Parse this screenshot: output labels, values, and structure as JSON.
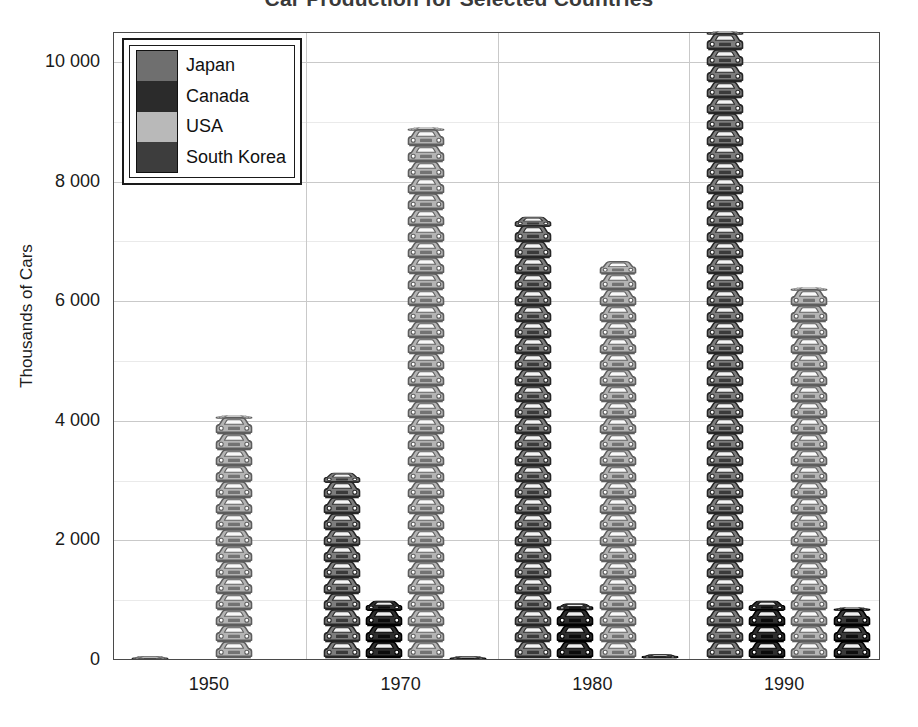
{
  "chart_data": {
    "type": "bar",
    "title": "Car Production for Selected Countries",
    "xlabel": "",
    "ylabel": "Thousands of Cars",
    "categories": [
      "1950",
      "1970",
      "1980",
      "1990"
    ],
    "ylim": [
      0,
      10800
    ],
    "yticks": [
      0,
      2000,
      4000,
      6000,
      8000,
      10000
    ],
    "ytick_labels": [
      "0",
      "2 000",
      "4 000",
      "6 000",
      "8 000",
      "10 000"
    ],
    "grid": true,
    "legend_position": "top-left",
    "units": "thousands of cars",
    "pictogram": "car-icon",
    "series": [
      {
        "name": "Japan",
        "color": "#7d7d7d",
        "values": [
          30,
          2900,
          6900,
          9800
        ]
      },
      {
        "name": "Canada",
        "color": "#2e2e2e",
        "values": [
          0,
          900,
          850,
          900
        ]
      },
      {
        "name": "USA",
        "color": "#b4b4b4",
        "values": [
          3800,
          8300,
          6200,
          5800
        ]
      },
      {
        "name": "South Korea",
        "color": "#3a3a3a",
        "values": [
          0,
          30,
          60,
          800
        ]
      }
    ]
  },
  "legend": {
    "entries": [
      {
        "label": "Japan",
        "color": "#6f6f6f"
      },
      {
        "label": "Canada",
        "color": "#2b2b2b"
      },
      {
        "label": "USA",
        "color": "#b9b9b9"
      },
      {
        "label": "South Korea",
        "color": "#3d3d3d"
      }
    ]
  },
  "axes": {
    "y_title": "Thousands of Cars",
    "y_tick_labels": [
      "10 000",
      "8 000",
      "6 000",
      "4 000",
      "2 000",
      "0"
    ],
    "x_tick_labels": [
      "1950",
      "1970",
      "1980",
      "1990"
    ]
  },
  "colors": {
    "axis": "#4a4a4a",
    "gridline": "#c9c9c9",
    "gridline_minor": "#eaeaea",
    "text": "#1a1a1a",
    "background": "#ffffff"
  }
}
